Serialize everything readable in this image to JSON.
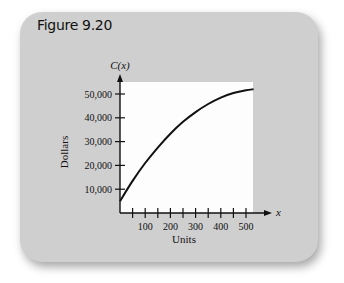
{
  "figure": {
    "title": "Figure 9.20"
  },
  "chart_data": {
    "type": "line",
    "title": "",
    "xlabel": "Units",
    "ylabel": "Dollars",
    "x_axis_symbol": "x",
    "y_axis_symbol": "C(x)",
    "x_ticks": [
      100,
      200,
      300,
      400,
      500
    ],
    "x_tick_labels": [
      "100",
      "200",
      "300",
      "400",
      "500"
    ],
    "x_minor_tick_step": 50,
    "y_ticks": [
      10000,
      20000,
      30000,
      40000,
      50000
    ],
    "y_tick_labels": [
      "10,000",
      "20,000",
      "30,000",
      "40,000",
      "50,000"
    ],
    "xlim": [
      0,
      530
    ],
    "ylim": [
      0,
      55000
    ],
    "grid": false,
    "legend": null,
    "series": [
      {
        "name": "C(x)",
        "x": [
          0,
          50,
          100,
          150,
          200,
          250,
          300,
          350,
          400,
          450,
          500,
          530
        ],
        "values": [
          5000,
          13500,
          21000,
          27500,
          33300,
          38300,
          42400,
          45800,
          48500,
          50400,
          51600,
          52000
        ]
      }
    ]
  }
}
